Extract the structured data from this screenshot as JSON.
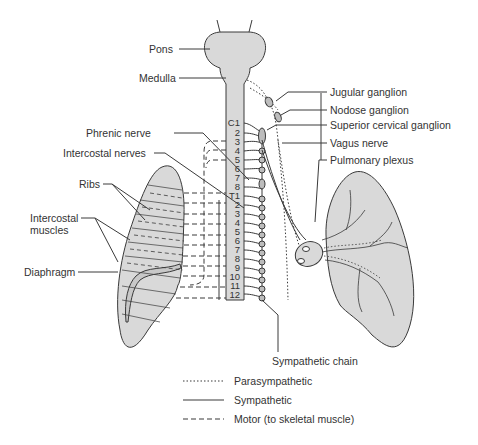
{
  "diagram": {
    "colors": {
      "tissue_fill": "#d9d9d9",
      "line": "#3a3a3a",
      "background": "#ffffff"
    },
    "labels_left": {
      "pons": "Pons",
      "medulla": "Medulla",
      "phrenic_nerve": "Phrenic nerve",
      "intercostal_nerves": "Intercostal nerves",
      "ribs": "Ribs",
      "intercostal_muscles_line1": "Intercostal",
      "intercostal_muscles_line2": "muscles",
      "diaphragm": "Diaphragm"
    },
    "labels_right": {
      "jugular_ganglion": "Jugular ganglion",
      "nodose_ganglion": "Nodose ganglion",
      "superior_cervical_ganglion": "Superior cervical ganglion",
      "vagus_nerve": "Vagus nerve",
      "pulmonary_plexus": "Pulmonary plexus",
      "sympathetic_chain": "Sympathetic chain"
    },
    "spinal_segments": {
      "cervical": [
        "C1",
        "2",
        "3",
        "4",
        "5",
        "6",
        "7",
        "8"
      ],
      "thoracic": [
        "T1",
        "2",
        "3",
        "4",
        "5",
        "6",
        "7",
        "8",
        "9",
        "10",
        "11",
        "12"
      ]
    },
    "legend": [
      {
        "style": "dotted",
        "label": "Parasympathetic"
      },
      {
        "style": "solid",
        "label": "Sympathetic"
      },
      {
        "style": "dashed",
        "label": "Motor (to skeletal muscle)"
      }
    ]
  }
}
